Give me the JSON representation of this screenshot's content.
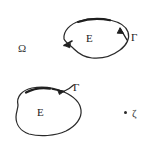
{
  "figure": {
    "type": "hand-drawn-math-diagram",
    "background_color": "#ffffff",
    "ink_color": "#2b2b2b",
    "width": 150,
    "height": 149,
    "labels": {
      "domain_omega": "Ω",
      "region_e_top": "E",
      "contour_gamma_top": "Γ",
      "region_e_bottom": "E",
      "contour_gamma_bottom": "Γ",
      "point_zeta": "ζ"
    },
    "elements": {
      "top_curve": {
        "name": "closed-contour-top",
        "orientation": "counterclockwise",
        "arrowheads": 2,
        "encloses": "E"
      },
      "bottom_curve": {
        "name": "closed-contour-bottom",
        "orientation": "counterclockwise",
        "arrowheads": 2,
        "encloses": "E"
      },
      "isolated_point": {
        "name": "point-zeta",
        "label": "ζ"
      }
    }
  }
}
